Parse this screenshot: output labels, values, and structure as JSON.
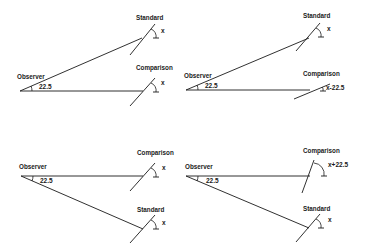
{
  "diagram": {
    "title": "",
    "panels": [
      {
        "id": "top-left",
        "observer_label": "Observer",
        "observer_angle": "22.5",
        "standard": {
          "label": "Standard",
          "angle_label": "x",
          "position": "upper"
        },
        "comparison": {
          "label": "Comparison",
          "angle_label": "x",
          "position": "straight-ahead"
        }
      },
      {
        "id": "top-right",
        "observer_label": "Observer",
        "observer_angle": "22.5",
        "standard": {
          "label": "Standard",
          "angle_label": "x",
          "position": "upper"
        },
        "comparison": {
          "label": "Comparison",
          "angle_label": "x-22.5",
          "position": "straight-ahead"
        }
      },
      {
        "id": "bottom-left",
        "observer_label": "Observer",
        "observer_angle": "22.5",
        "standard": {
          "label": "Standard",
          "angle_label": "x",
          "position": "lower"
        },
        "comparison": {
          "label": "Comparison",
          "angle_label": "x",
          "position": "straight-ahead"
        }
      },
      {
        "id": "bottom-right",
        "observer_label": "Observer",
        "observer_angle": "22.5",
        "standard": {
          "label": "Standard",
          "angle_label": "x",
          "position": "lower"
        },
        "comparison": {
          "label": "Comparison",
          "angle_label": "x+22.5",
          "position": "straight-ahead"
        }
      }
    ]
  }
}
